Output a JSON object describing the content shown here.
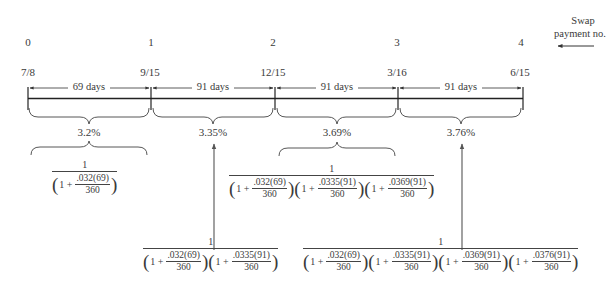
{
  "diagram": {
    "legend": {
      "line1": "Swap",
      "line2": "payment no."
    },
    "payment_numbers": [
      "0",
      "1",
      "2",
      "3",
      "4"
    ],
    "dates": [
      "7/8",
      "9/15",
      "12/15",
      "3/16",
      "6/15"
    ],
    "periods": [
      {
        "days": "69 days",
        "rate": "3.2%"
      },
      {
        "days": "91 days",
        "rate": "3.35%"
      },
      {
        "days": "91 days",
        "rate": "3.69%"
      },
      {
        "days": "91 days",
        "rate": "3.76%"
      }
    ],
    "discount_factors": [
      {
        "numerator": "1",
        "terms": [
          {
            "one_plus": "1 +",
            "num": ".032(69)",
            "den": "360"
          }
        ]
      },
      {
        "numerator": "1",
        "terms": [
          {
            "one_plus": "1 +",
            "num": ".032(69)",
            "den": "360"
          },
          {
            "one_plus": "1 +",
            "num": ".0335(91)",
            "den": "360"
          }
        ]
      },
      {
        "numerator": "1",
        "terms": [
          {
            "one_plus": "1 +",
            "num": ".032(69)",
            "den": "360"
          },
          {
            "one_plus": "1 +",
            "num": ".0335(91)",
            "den": "360"
          },
          {
            "one_plus": "1 +",
            "num": ".0369(91)",
            "den": "360"
          }
        ]
      },
      {
        "numerator": "1",
        "terms": [
          {
            "one_plus": "1 +",
            "num": ".032(69)",
            "den": "360"
          },
          {
            "one_plus": "1 +",
            "num": ".0335(91)",
            "den": "360"
          },
          {
            "one_plus": "1 +",
            "num": ".0369(91)",
            "den": "360"
          },
          {
            "one_plus": "1 +",
            "num": ".0376(91)",
            "den": "360"
          }
        ]
      }
    ],
    "colors": {
      "ink": "#3a3a3a",
      "arrow": "#7a7a7a"
    }
  }
}
